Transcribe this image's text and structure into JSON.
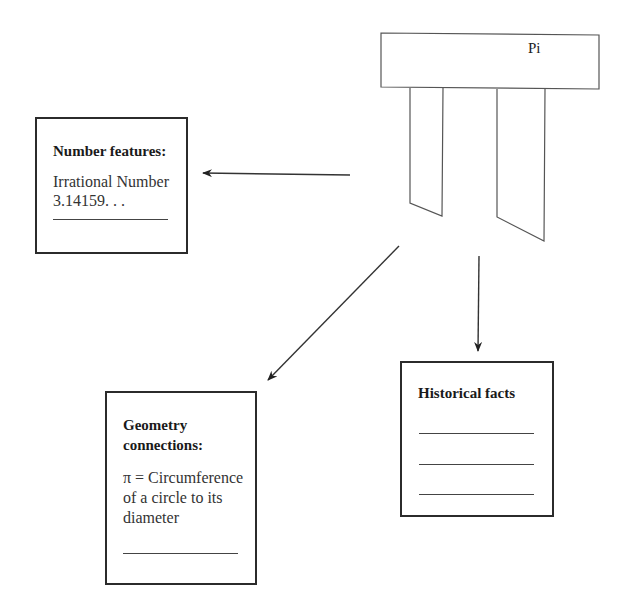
{
  "diagram": {
    "central_topic": {
      "label": "Pi"
    },
    "boxes": [
      {
        "id": "number-features",
        "title": "Number features:",
        "lines": [
          "Irrational Number",
          "3.14159. . ."
        ],
        "blank_lines": 1
      },
      {
        "id": "geometry-connections",
        "title_lines": [
          "Geometry",
          "connections:"
        ],
        "lines": [
          "π = Circumference",
          "of a circle to its",
          "diameter"
        ],
        "blank_lines": 1
      },
      {
        "id": "historical-facts",
        "title": "Historical facts",
        "lines": [],
        "blank_lines": 3
      }
    ],
    "arrows": [
      {
        "from": "Pi",
        "to": "number-features",
        "direction": "left"
      },
      {
        "from": "Pi",
        "to": "geometry-connections",
        "direction": "down-left"
      },
      {
        "from": "Pi",
        "to": "historical-facts",
        "direction": "down"
      }
    ]
  },
  "colors": {
    "stroke": "#2b2b2b",
    "background": "#ffffff"
  }
}
